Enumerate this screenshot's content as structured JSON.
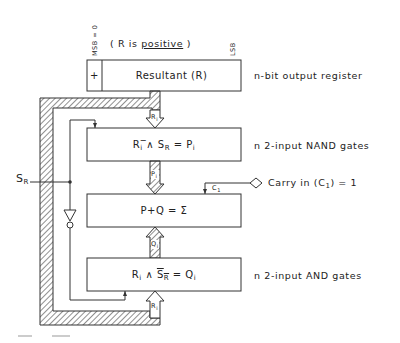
{
  "diagram": {
    "register": {
      "msb_label": "MSB = 0",
      "lsb_label": "LSB",
      "sign_note_prefix": "( R is ",
      "sign_note_word": "positive",
      "sign_note_suffix": " )",
      "sign_cell": "+",
      "title": "Resultant (R)",
      "description": "n-bit output register"
    },
    "nand_block": {
      "formula_R": "R",
      "formula_i": "i",
      "formula_op": " ̅∧ ",
      "formula_S": "S",
      "formula_SR_sub": "R",
      "formula_eq": " = P",
      "formula_Pi_sub": "i",
      "description": "n 2-input NAND gates"
    },
    "adder_block": {
      "formula": "P+Q = Σ",
      "carry_label": "C",
      "carry_sub": "1",
      "carry_in_text_prefix": "Carry in (C",
      "carry_in_text_sub": "1",
      "carry_in_text_suffix": ") = 1"
    },
    "and_block": {
      "formula_R": "R",
      "formula_i": "i",
      "formula_op": " ∧ ",
      "formula_S": "S",
      "formula_SR_sub": "R",
      "formula_eq": " = Q",
      "formula_Qi_sub": "i",
      "description": "n 2-input AND gates"
    },
    "signals": {
      "sr_label": "S",
      "sr_sub": "R",
      "bus_R": "R",
      "bus_R_sub": "i",
      "bus_P": "P",
      "bus_P_sub": "i",
      "bus_Q": "Q",
      "bus_Q_sub": "i"
    },
    "colors": {
      "line": "#333333",
      "hatch": "#444444",
      "background": "#ffffff"
    }
  }
}
